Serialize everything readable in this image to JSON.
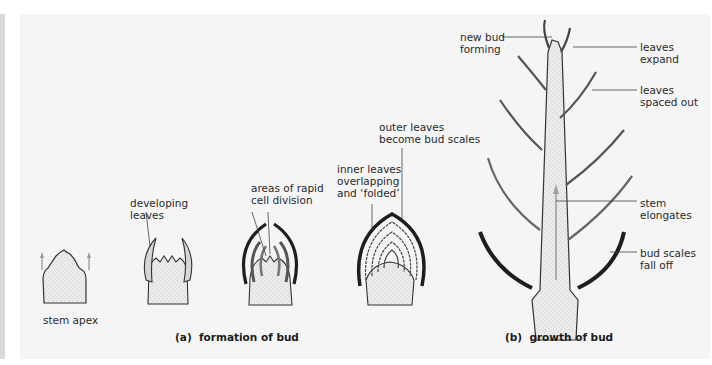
{
  "figure": {
    "panel_a": {
      "caption": "(a)  formation of bud",
      "stages": [
        {
          "label": "stem apex"
        },
        {
          "label": "developing\nleaves"
        },
        {
          "label": "areas of rapid\ncell division"
        },
        {
          "label_inner": "inner leaves\noverlapping\nand ‘folded’",
          "label_outer": "outer leaves\nbecome bud scales"
        }
      ]
    },
    "panel_b": {
      "caption": "(b)  growth of bud",
      "labels": {
        "new_bud": "new bud\nforming",
        "leaves_expand": "leaves\nexpand",
        "leaves_spaced": "leaves\nspaced out",
        "stem_elongates": "stem\nelongates",
        "bud_scales": "bud scales\nfall off"
      }
    },
    "colors": {
      "background_panel": "#f5f5f5",
      "stem_fill": "#e6e6e6",
      "outline": "#333333",
      "bud_scale": "#2b2b2b",
      "arrow": "#a0a0a0"
    }
  }
}
